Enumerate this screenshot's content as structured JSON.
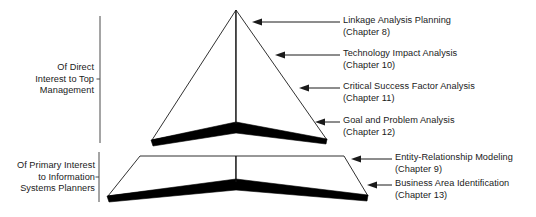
{
  "figure": {
    "type": "layered-pyramid-diagram",
    "background_color": "#ffffff",
    "line_color": "#1a1a1a",
    "shadow_color": "#000000"
  },
  "brackets": [
    {
      "name": "top-management",
      "text": "Of Direct\nInterest to Top\nManagement"
    },
    {
      "name": "is-planners",
      "text": "Of Primary Interest\nto Information\nSystems Planners"
    }
  ],
  "callouts": [
    {
      "title": "Linkage Analysis Planning",
      "chapter": "(Chapter 8)"
    },
    {
      "title": "Technology Impact Analysis",
      "chapter": "(Chapter 10)"
    },
    {
      "title": "Critical Success Factor Analysis",
      "chapter": "(Chapter 11)"
    },
    {
      "title": "Goal and Problem Analysis",
      "chapter": "(Chapter 12)"
    },
    {
      "title": "Entity-Relationship Modeling",
      "chapter": "(Chapter 9)"
    },
    {
      "title": "Business Area Identification",
      "chapter": "(Chapter 13)"
    }
  ]
}
